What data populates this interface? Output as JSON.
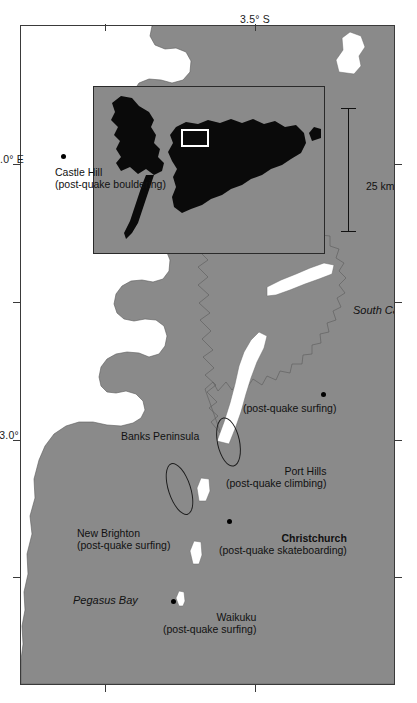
{
  "figure": {
    "kind": "map",
    "region": "Christchurch and Banks Peninsula, Canterbury, New Zealand",
    "orientation_note": "printed rotated 90 degrees counter-clockwise"
  },
  "colors": {
    "land": "#8a8a8a",
    "sea": "#ffffff",
    "inset_land": "#0a0a0a",
    "inset_sea": "#8a8a8a",
    "frame": "#3a3a3a",
    "text": "#111111",
    "highlight_box": "#ffffff"
  },
  "axis": {
    "longitude_labels": [
      {
        "id": "lon-172",
        "text": "172.0° E"
      },
      {
        "id": "lon-173",
        "text": "173.0°"
      }
    ],
    "latitude_labels": [
      {
        "id": "lat-43-5",
        "text": "3.5° S"
      }
    ]
  },
  "water_bodies": [
    {
      "id": "pegasus-bay",
      "name": "Pegasus Bay"
    },
    {
      "id": "south-canterbury-bight",
      "name": "South Canterbury Bight"
    }
  ],
  "places": [
    {
      "id": "waikuku",
      "name": "Waikuku",
      "activity": "(post-quake surfing)",
      "bold": false,
      "marker": "dot"
    },
    {
      "id": "new-brighton",
      "name": "New Brighton",
      "activity": "(post-quake surfing)",
      "bold": false,
      "marker": "ellipse"
    },
    {
      "id": "christchurch",
      "name": "Christchurch",
      "activity": "(post-quake skateboarding)",
      "bold": true,
      "marker": "dot"
    },
    {
      "id": "port-hills",
      "name": "Port Hills",
      "activity": "(post-quake climbing)",
      "bold": false,
      "marker": "ellipse"
    },
    {
      "id": "banks-peninsula-surf",
      "name": "",
      "activity": "(post-quake surfing)",
      "bold": false,
      "marker": "dot"
    },
    {
      "id": "castle-hill",
      "name": "Castle Hill",
      "activity": "(post-quake bouldering)",
      "bold": false,
      "marker": "dot"
    }
  ],
  "landforms": [
    {
      "id": "banks-peninsula",
      "name": "Banks Peninsula"
    }
  ],
  "scale_bar": {
    "label": "25 km"
  },
  "inset": {
    "title": "",
    "description": "New Zealand locator map with study-area box",
    "highlight_label": ""
  }
}
